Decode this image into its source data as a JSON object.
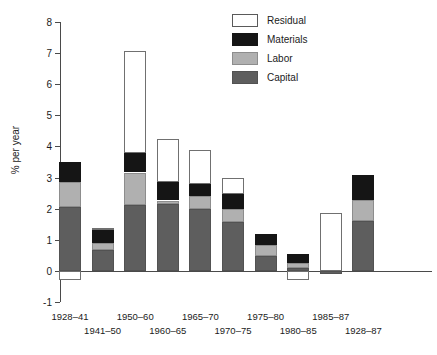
{
  "chart_data": {
    "type": "bar",
    "title": "",
    "xlabel": "",
    "ylabel": "% per year",
    "ylim": [
      -1,
      8
    ],
    "yticks": [
      -1,
      0,
      1,
      2,
      3,
      4,
      5,
      6,
      7,
      8
    ],
    "ytick_labels": [
      "-1",
      "0",
      "1",
      "2",
      "3",
      "4",
      "5",
      "6",
      "7",
      "8"
    ],
    "grid": false,
    "stacked": true,
    "legend_position": "top-right",
    "categories": [
      "1928-41",
      "1941-50",
      "1950-60",
      "1960-65",
      "1965-70",
      "1970-75",
      "1975-80",
      "1980-85",
      "1985-87",
      "1928-87"
    ],
    "series": [
      {
        "name": "Capital",
        "color": "#5e5e5e",
        "values": [
          2.07,
          0.67,
          2.13,
          2.15,
          2.0,
          1.57,
          0.5,
          0.1,
          -0.1,
          1.6
        ]
      },
      {
        "name": "Labor",
        "color": "#b0b0b0",
        "values": [
          0.8,
          0.23,
          1.04,
          0.12,
          0.4,
          0.43,
          0.33,
          0.17,
          0.0,
          0.7
        ]
      },
      {
        "name": "Materials",
        "color": "#151515",
        "values": [
          0.63,
          0.42,
          0.63,
          0.58,
          0.4,
          0.47,
          0.37,
          0.28,
          0.0,
          0.8
        ]
      },
      {
        "name": "Residual",
        "color": "#ffffff",
        "values": [
          -0.3,
          0.08,
          3.27,
          1.4,
          1.1,
          0.53,
          0.0,
          -0.3,
          1.87,
          0.0
        ]
      }
    ],
    "bar_totals_positive": [
      3.5,
      1.4,
      7.07,
      4.25,
      3.9,
      3.0,
      1.2,
      0.55,
      1.87,
      3.1
    ]
  },
  "legend": {
    "items": [
      {
        "label": "Residual",
        "swatch": "residual"
      },
      {
        "label": "Materials",
        "swatch": "materials"
      },
      {
        "label": "Labor",
        "swatch": "labor"
      },
      {
        "label": "Capital",
        "swatch": "capital"
      }
    ]
  },
  "axis": {
    "y_title": "% per year"
  }
}
